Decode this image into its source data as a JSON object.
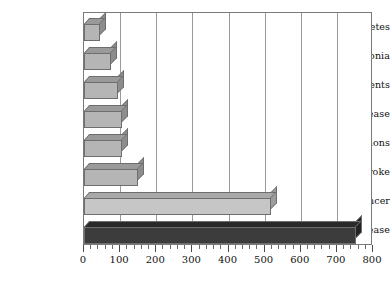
{
  "chart_data": {
    "type": "bar",
    "orientation": "horizontal",
    "title": "",
    "xlabel": "",
    "ylabel": "",
    "xlim": [
      0,
      800
    ],
    "ylim": null,
    "grid": true,
    "legend": null,
    "xticks": [
      0,
      100,
      200,
      300,
      400,
      500,
      600,
      700,
      800
    ],
    "xtick_labels": [
      "0",
      "100",
      "200",
      "300",
      "400",
      "500",
      "600",
      "700",
      "800"
    ],
    "minor_tick_interval": 20,
    "categories": [
      "diabetes",
      "pneumonia",
      "accidents",
      "lung disease",
      "drug reactions",
      "stroke",
      "cancer",
      "heart disease"
    ],
    "values": [
      45,
      75,
      95,
      105,
      106,
      150,
      518,
      753
    ],
    "bar_colors": [
      "#b5b5b5",
      "#b5b5b5",
      "#b5b5b5",
      "#b5b5b5",
      "#b5b5b5",
      "#b5b5b5",
      "#c6c6c6",
      "#3c3c3c"
    ],
    "bar_top_colors": [
      "#9a9a9a",
      "#9a9a9a",
      "#9a9a9a",
      "#9a9a9a",
      "#9a9a9a",
      "#9a9a9a",
      "#a9a9a9",
      "#2a2a2a"
    ],
    "bar_side_colors": [
      "#8d8d8d",
      "#8d8d8d",
      "#8d8d8d",
      "#8d8d8d",
      "#8d8d8d",
      "#8d8d8d",
      "#9c9c9c",
      "#222222"
    ],
    "axis_color": "#7a7a7a",
    "gridline_color": "#9a9a9a",
    "text_color": "#111111",
    "background": "#ffffff"
  }
}
